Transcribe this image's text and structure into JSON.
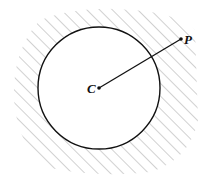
{
  "diagram": {
    "center_label": "C",
    "point_label": "P",
    "circle": {
      "cx": 99,
      "cy": 88,
      "r": 61
    },
    "point": {
      "x": 181,
      "y": 39
    },
    "colors": {
      "stroke": "#111111",
      "hatch": "#9a9a9a",
      "background": "#ffffff"
    }
  }
}
